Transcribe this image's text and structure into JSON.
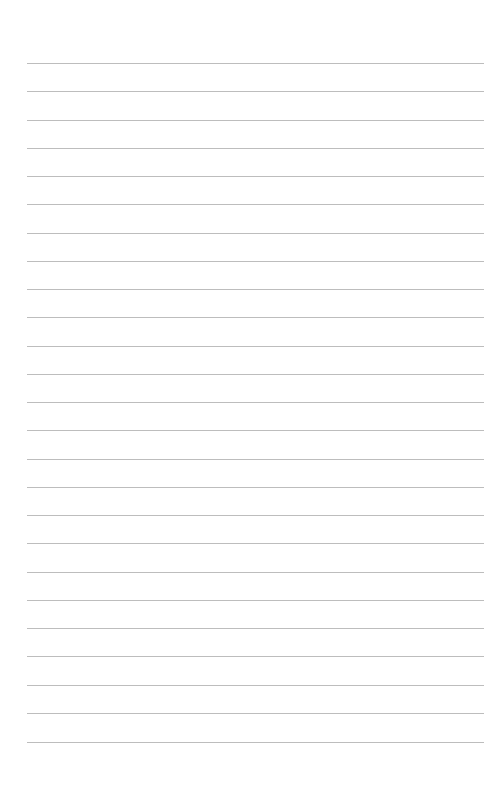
{
  "document": {
    "kind": "ruled-notebook-page",
    "title": "Lined Paper",
    "page_width": 491,
    "page_height": 785,
    "background_color": "#ffffff",
    "orientation": "portrait",
    "content_text": ""
  },
  "ruling": {
    "line_color": "#bdbdbd",
    "line_thickness_px": 1,
    "line_count": 25,
    "line_left_x": 27,
    "line_right_x": 484,
    "line_width_px": 457,
    "first_line_y": 63,
    "line_spacing_px": 28.3,
    "last_line_y": 742,
    "top_margin_px": 63,
    "bottom_margin_px": 43,
    "left_margin_px": 27,
    "right_margin_px": 7,
    "margin_rule_visible": false,
    "line_y_positions": [
      63,
      91,
      120,
      148,
      176,
      204,
      233,
      261,
      289,
      317,
      346,
      374,
      402,
      430,
      459,
      487,
      515,
      543,
      572,
      600,
      628,
      656,
      685,
      713,
      742
    ]
  },
  "writing_area": {
    "label": "writing-area",
    "placeholder": "",
    "value": ""
  }
}
